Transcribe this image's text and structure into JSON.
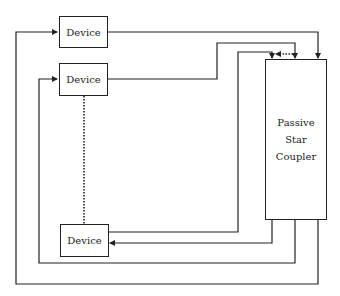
{
  "diagram": {
    "devices": [
      {
        "label": "Device"
      },
      {
        "label": "Device"
      },
      {
        "label": "Device"
      }
    ],
    "coupler": {
      "lines": [
        "Passive",
        "Star",
        "Coupler"
      ]
    },
    "colors": {
      "line": "#222222",
      "background": "#ffffff"
    }
  }
}
